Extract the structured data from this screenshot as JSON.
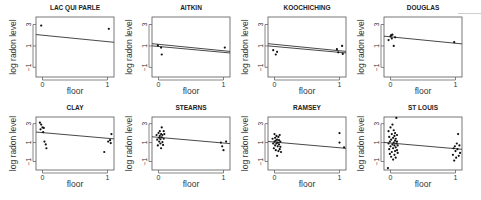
{
  "chart_data": {
    "type": "scatter",
    "layout": {
      "rows": 2,
      "cols": 4,
      "grid": false,
      "legend": "none"
    },
    "xlabel": "floor",
    "ylabel": "log radon level",
    "xticks": [
      0,
      1
    ],
    "yticks": [
      -1,
      1,
      3
    ],
    "xlim": [
      -0.1,
      1.1
    ],
    "ylim": [
      -1.9,
      3.7
    ],
    "panels": [
      {
        "title": "LAC QUI PARLE",
        "lines": [
          {
            "intercept": 2.0,
            "slope": -0.6
          }
        ],
        "points": [
          [
            -0.02,
            2.9
          ],
          [
            1.02,
            2.6
          ]
        ]
      },
      {
        "title": "AITKIN",
        "lines": [
          {
            "intercept": 1.15,
            "slope": -0.6
          },
          {
            "intercept": 0.95,
            "slope": -0.55
          }
        ],
        "points": [
          [
            -0.01,
            1.05
          ],
          [
            0.04,
            0.85
          ],
          [
            0.05,
            0.2
          ],
          [
            1.02,
            0.85
          ]
        ]
      },
      {
        "title": "KOOCHICHING",
        "lines": [
          {
            "intercept": 1.15,
            "slope": -0.6
          },
          {
            "intercept": 0.95,
            "slope": -0.55
          }
        ],
        "points": [
          [
            -0.02,
            0.6
          ],
          [
            0.02,
            0.2
          ],
          [
            0.04,
            0.45
          ],
          [
            0.96,
            0.7
          ],
          [
            0.98,
            0.4
          ],
          [
            1.04,
            1.0
          ],
          [
            1.05,
            0.25
          ]
        ]
      },
      {
        "title": "DOUGLAS",
        "lines": [
          {
            "intercept": 1.85,
            "slope": -0.6
          }
        ],
        "points": [
          [
            -0.03,
            1.55
          ],
          [
            0.0,
            1.9
          ],
          [
            0.01,
            2.0
          ],
          [
            0.02,
            1.7
          ],
          [
            0.03,
            2.05
          ],
          [
            0.05,
            1.0
          ],
          [
            0.07,
            1.8
          ],
          [
            0.98,
            1.35
          ]
        ]
      },
      {
        "title": "CLAY",
        "lines": [
          {
            "intercept": 2.05,
            "slope": -0.6
          }
        ],
        "points": [
          [
            -0.04,
            3.1
          ],
          [
            -0.02,
            2.9
          ],
          [
            -0.03,
            2.4
          ],
          [
            0.0,
            2.6
          ],
          [
            0.01,
            2.1
          ],
          [
            0.02,
            2.55
          ],
          [
            0.03,
            1.1
          ],
          [
            0.05,
            0.8
          ],
          [
            0.06,
            0.4
          ],
          [
            0.95,
            0.0
          ],
          [
            1.01,
            1.1
          ],
          [
            1.04,
            1.25
          ],
          [
            1.05,
            0.95
          ],
          [
            1.06,
            1.9
          ]
        ]
      },
      {
        "title": "STEARNS",
        "lines": [
          {
            "intercept": 1.55,
            "slope": -0.6
          }
        ],
        "points": [
          [
            -0.03,
            1.8
          ],
          [
            -0.02,
            1.3
          ],
          [
            -0.01,
            0.7
          ],
          [
            0.0,
            2.0
          ],
          [
            0.01,
            1.5
          ],
          [
            0.01,
            1.1
          ],
          [
            0.02,
            2.2
          ],
          [
            0.02,
            1.7
          ],
          [
            0.03,
            0.9
          ],
          [
            0.03,
            1.35
          ],
          [
            0.04,
            1.9
          ],
          [
            0.04,
            0.4
          ],
          [
            0.05,
            2.6
          ],
          [
            0.05,
            1.55
          ],
          [
            0.06,
            1.05
          ],
          [
            0.06,
            1.8
          ],
          [
            0.07,
            0.75
          ],
          [
            0.08,
            2.2
          ],
          [
            0.08,
            1.4
          ],
          [
            0.09,
            1.9
          ],
          [
            0.96,
            1.0
          ],
          [
            0.98,
            0.6
          ],
          [
            1.0,
            0.2
          ],
          [
            1.04,
            1.1
          ]
        ]
      },
      {
        "title": "RAMSEY",
        "lines": [
          {
            "intercept": 1.05,
            "slope": -0.6
          }
        ],
        "points": [
          [
            -0.03,
            1.4
          ],
          [
            -0.02,
            0.9
          ],
          [
            -0.01,
            0.4
          ],
          [
            0.0,
            1.9
          ],
          [
            0.0,
            1.1
          ],
          [
            0.01,
            0.7
          ],
          [
            0.01,
            1.5
          ],
          [
            0.02,
            0.2
          ],
          [
            0.02,
            1.2
          ],
          [
            0.03,
            1.7
          ],
          [
            0.03,
            0.9
          ],
          [
            0.04,
            -0.4
          ],
          [
            0.04,
            1.3
          ],
          [
            0.05,
            0.6
          ],
          [
            0.05,
            1.0
          ],
          [
            0.06,
            1.6
          ],
          [
            0.06,
            0.1
          ],
          [
            0.07,
            0.8
          ],
          [
            0.07,
            1.25
          ],
          [
            0.08,
            0.3
          ],
          [
            0.08,
            1.8
          ],
          [
            0.09,
            0.55
          ],
          [
            0.09,
            1.1
          ],
          [
            0.1,
            0.0
          ],
          [
            1.0,
            2.0
          ],
          [
            1.0,
            1.0
          ],
          [
            1.07,
            0.5
          ]
        ]
      },
      {
        "title": "ST LOUIS",
        "lines": [
          {
            "intercept": 0.95,
            "slope": -0.6
          }
        ],
        "points": [
          [
            -0.04,
            -1.7
          ],
          [
            -0.03,
            0.9
          ],
          [
            -0.03,
            2.2
          ],
          [
            -0.02,
            0.3
          ],
          [
            -0.02,
            1.6
          ],
          [
            -0.01,
            -0.2
          ],
          [
            -0.01,
            1.1
          ],
          [
            0.0,
            0.6
          ],
          [
            0.0,
            2.6
          ],
          [
            0.01,
            -0.5
          ],
          [
            0.01,
            1.3
          ],
          [
            0.02,
            0.0
          ],
          [
            0.02,
            1.9
          ],
          [
            0.03,
            0.8
          ],
          [
            0.03,
            2.9
          ],
          [
            0.04,
            -0.8
          ],
          [
            0.04,
            0.4
          ],
          [
            0.04,
            1.5
          ],
          [
            0.05,
            1.0
          ],
          [
            0.05,
            2.3
          ],
          [
            0.06,
            -0.3
          ],
          [
            0.06,
            0.7
          ],
          [
            0.06,
            1.7
          ],
          [
            0.07,
            0.1
          ],
          [
            0.07,
            1.2
          ],
          [
            0.07,
            2.0
          ],
          [
            0.08,
            -0.6
          ],
          [
            0.08,
            0.5
          ],
          [
            0.08,
            1.4
          ],
          [
            0.09,
            0.9
          ],
          [
            0.09,
            3.6
          ],
          [
            0.1,
            0.2
          ],
          [
            0.1,
            1.1
          ],
          [
            0.1,
            1.8
          ],
          [
            0.11,
            -0.1
          ],
          [
            0.11,
            0.7
          ],
          [
            0.96,
            -0.3
          ],
          [
            0.97,
            0.4
          ],
          [
            0.98,
            -0.9
          ],
          [
            0.99,
            0.6
          ],
          [
            1.0,
            0.1
          ],
          [
            1.01,
            -0.6
          ],
          [
            1.02,
            0.9
          ],
          [
            1.03,
            0.3
          ],
          [
            1.04,
            1.9
          ],
          [
            1.05,
            -0.4
          ],
          [
            1.06,
            0.7
          ],
          [
            1.07,
            -0.1
          ]
        ]
      }
    ]
  }
}
